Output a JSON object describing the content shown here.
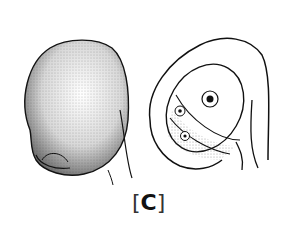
{
  "figure": {
    "label_open": "[",
    "label_letter": "C",
    "label_close": "]",
    "left_drawing": "stippled-ovule-exterior",
    "right_drawing": "ovule-longitudinal-section",
    "ink_color": "#111111",
    "background": "#ffffff"
  }
}
